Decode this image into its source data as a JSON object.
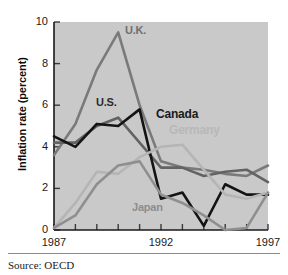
{
  "figure": {
    "source_note": "Source: OECD",
    "background": "#ffffff",
    "plot_background": "#c9c9c9"
  },
  "chart_data": {
    "type": "line",
    "title": "",
    "xlabel": "",
    "ylabel": "Inflation rate (percent)",
    "xlim": [
      1987,
      1997
    ],
    "ylim": [
      0,
      10
    ],
    "yticks": [
      0,
      2,
      4,
      6,
      8,
      10
    ],
    "ytick_labels": [
      "0",
      "2",
      "4",
      "6",
      "8",
      "10"
    ],
    "xticks": [
      1987,
      1988,
      1989,
      1990,
      1991,
      1992,
      1993,
      1994,
      1995,
      1996,
      1997
    ],
    "xtick_labels_shown": [
      "1987",
      "1992",
      "1997"
    ],
    "grid": false,
    "legend": "inline-annotations",
    "x": [
      1987,
      1988,
      1989,
      1990,
      1991,
      1992,
      1993,
      1994,
      1995,
      1996,
      1997
    ],
    "series": [
      {
        "name": "U.K.",
        "color": "#7a7a7a",
        "width": 2.6,
        "label_position": "above-peak",
        "values": [
          3.6,
          5.1,
          7.7,
          9.5,
          6.0,
          3.3,
          3.0,
          2.9,
          2.7,
          2.6,
          3.1
        ]
      },
      {
        "name": "U.S.",
        "color": "#636363",
        "width": 2.6,
        "label_position": "left-of-peak",
        "values": [
          4.2,
          4.2,
          5.0,
          5.4,
          4.2,
          3.0,
          3.0,
          2.6,
          2.8,
          2.9,
          2.3
        ]
      },
      {
        "name": "Canada",
        "color": "#141414",
        "width": 2.6,
        "label_position": "right-of-peak",
        "values": [
          4.5,
          4.0,
          5.1,
          5.0,
          5.8,
          1.5,
          1.8,
          0.2,
          2.2,
          1.7,
          1.7
        ]
      },
      {
        "name": "Germany",
        "color": "#b5b5b5",
        "width": 2.6,
        "label_position": "right-middle",
        "values": [
          0.1,
          1.3,
          2.8,
          2.7,
          3.5,
          4.0,
          4.1,
          2.9,
          1.7,
          1.5,
          1.8
        ]
      },
      {
        "name": "Japan",
        "color": "#8f8f8f",
        "width": 2.6,
        "label_position": "bottom-middle",
        "values": [
          0.1,
          0.7,
          2.2,
          3.1,
          3.3,
          1.7,
          1.3,
          0.7,
          0.0,
          0.1,
          1.8
        ]
      }
    ]
  }
}
